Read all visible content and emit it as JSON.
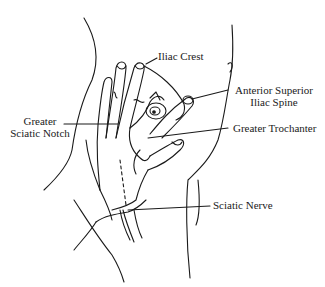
{
  "figure": {
    "stroke_color": "#1a1a1a",
    "background": "#ffffff"
  },
  "labels": {
    "iliac_crest": "Iliac Crest",
    "asis_line1": "Anterior Superior",
    "asis_line2": "Iliac Spine",
    "greater_sciatic_notch_line1": "Greater",
    "greater_sciatic_notch_line2": "Sciatic Notch",
    "greater_trochanter": "Greater Trochanter",
    "sciatic_nerve": "Sciatic Nerve"
  }
}
